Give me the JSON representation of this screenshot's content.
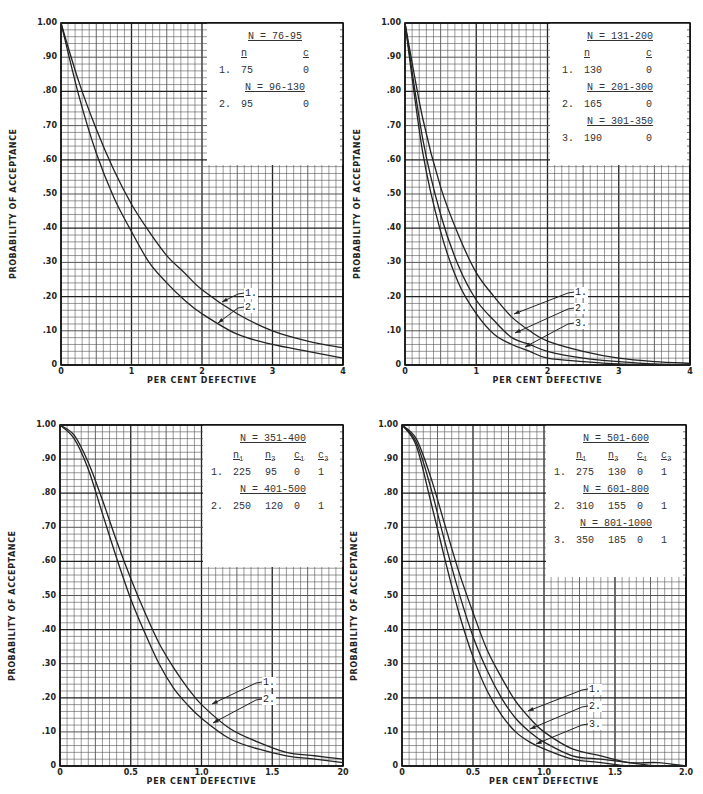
{
  "charts": [
    {
      "id": "tl",
      "box": {
        "left": 61,
        "top": 23,
        "width": 282,
        "height": 342
      },
      "x_label": "PER CENT DEFECTIVE",
      "y_label": "PROBABILITY OF ACCEPTANCE",
      "x_ticks": [
        "0",
        "1",
        "2",
        "3",
        "4"
      ],
      "x_max": 4,
      "y_ticks": [
        "0",
        ".10",
        ".20",
        ".30",
        ".40",
        ".50",
        ".60",
        ".70",
        ".80",
        ".90",
        "1.00"
      ],
      "legend": {
        "box": {
          "left": 207,
          "top": 23,
          "width": 136,
          "height": 142
        },
        "columns": [
          "n",
          "c"
        ],
        "groups": [
          {
            "header": "N = 76-95",
            "row": {
              "label": "1.",
              "values": [
                "75",
                "0"
              ]
            }
          },
          {
            "header": "N = 96-130",
            "row": {
              "label": "2.",
              "values": [
                "95",
                "0"
              ]
            }
          }
        ]
      },
      "callouts": [
        {
          "label": "1.",
          "text_x": 240,
          "text_y": 288,
          "arrow_to_x": 222,
          "arrow_to_y": 302
        },
        {
          "label": "2.",
          "text_x": 240,
          "text_y": 302,
          "arrow_to_x": 218,
          "arrow_to_y": 323
        }
      ]
    },
    {
      "id": "tr",
      "box": {
        "left": 405,
        "top": 23,
        "width": 285,
        "height": 342
      },
      "x_label": "PER CENT DEFECTIVE",
      "y_label": "PROBABILITY OF ACCEPTANCE",
      "x_ticks": [
        "0",
        "1",
        "2",
        "3",
        "4"
      ],
      "x_max": 4,
      "y_ticks": [
        "0",
        ".10",
        ".20",
        ".30",
        ".40",
        ".50",
        ".60",
        ".70",
        ".80",
        ".90",
        "1.00"
      ],
      "legend": {
        "box": {
          "left": 550,
          "top": 23,
          "width": 140,
          "height": 142
        },
        "columns": [
          "n",
          "c"
        ],
        "groups": [
          {
            "header": "N = 131-200",
            "row": {
              "label": "1.",
              "values": [
                "130",
                "0"
              ]
            }
          },
          {
            "header": "N = 201-300",
            "row": {
              "label": "2.",
              "values": [
                "165",
                "0"
              ]
            }
          },
          {
            "header": "N = 301-350",
            "row": {
              "label": "3.",
              "values": [
                "190",
                "0"
              ]
            }
          }
        ]
      },
      "callouts": [
        {
          "label": "1.",
          "text_x": 570,
          "text_y": 287,
          "arrow_to_x": 514,
          "arrow_to_y": 314
        },
        {
          "label": "2.",
          "text_x": 570,
          "text_y": 303,
          "arrow_to_x": 515,
          "arrow_to_y": 333
        },
        {
          "label": "3.",
          "text_x": 570,
          "text_y": 318,
          "arrow_to_x": 525,
          "arrow_to_y": 347
        }
      ]
    },
    {
      "id": "bl",
      "box": {
        "left": 60,
        "top": 425,
        "width": 283,
        "height": 341
      },
      "x_label": "PER CENT DEFECTIVE",
      "y_label": "PROBABILITY OF ACCEPTANCE",
      "x_ticks": [
        "0",
        "0.5",
        "1.0",
        "1.5",
        "20"
      ],
      "x_max": 2,
      "y_ticks": [
        "0",
        ".10",
        ".20",
        ".30",
        ".40",
        ".50",
        ".60",
        ".70",
        ".80",
        ".90",
        "1.00"
      ],
      "legend": {
        "box": {
          "left": 203,
          "top": 425,
          "width": 140,
          "height": 142
        },
        "columns": [
          "n1",
          "n2",
          "c1",
          "c2"
        ],
        "groups": [
          {
            "header": "N = 351-400",
            "row": {
              "label": "1.",
              "values": [
                "225",
                "95",
                "0",
                "1"
              ]
            }
          },
          {
            "header": "N = 401-500",
            "row": {
              "label": "2.",
              "values": [
                "250",
                "120",
                "0",
                "1"
              ]
            }
          }
        ]
      },
      "callouts": [
        {
          "label": "1.",
          "text_x": 258,
          "text_y": 677,
          "arrow_to_x": 212,
          "arrow_to_y": 704
        },
        {
          "label": "2.",
          "text_x": 258,
          "text_y": 694,
          "arrow_to_x": 213,
          "arrow_to_y": 723
        }
      ]
    },
    {
      "id": "br",
      "box": {
        "left": 402,
        "top": 425,
        "width": 284,
        "height": 341
      },
      "x_label": "PER CENT DEFECTIVE",
      "y_label": "PROBABILITY OF ACCEPTANCE",
      "x_ticks": [
        "0",
        "0.5",
        "1.0",
        "1.5",
        "2.0"
      ],
      "x_max": 2,
      "y_ticks": [
        "0",
        ".10",
        ".20",
        ".30",
        ".40",
        ".50",
        ".60",
        ".70",
        ".80",
        ".90",
        "1.00"
      ],
      "legend": {
        "box": {
          "left": 546,
          "top": 425,
          "width": 140,
          "height": 152
        },
        "columns": [
          "n1",
          "n2",
          "c1",
          "c2"
        ],
        "groups": [
          {
            "header": "N = 501-600",
            "row": {
              "label": "1.",
              "values": [
                "275",
                "130",
                "0",
                "1"
              ]
            }
          },
          {
            "header": "N = 601-800",
            "row": {
              "label": "2.",
              "values": [
                "310",
                "155",
                "0",
                "1"
              ]
            }
          },
          {
            "header": "N = 801-1000",
            "row": {
              "label": "3.",
              "values": [
                "350",
                "185",
                "0",
                "1"
              ]
            }
          }
        ]
      },
      "callouts": [
        {
          "label": "1.",
          "text_x": 584,
          "text_y": 684,
          "arrow_to_x": 528,
          "arrow_to_y": 711
        },
        {
          "label": "2.",
          "text_x": 584,
          "text_y": 701,
          "arrow_to_x": 530,
          "arrow_to_y": 729
        },
        {
          "label": "3.",
          "text_x": 584,
          "text_y": 719,
          "arrow_to_x": 536,
          "arrow_to_y": 744
        }
      ]
    }
  ],
  "chart_data": [
    {
      "type": "line",
      "title": "",
      "xlabel": "PER CENT DEFECTIVE",
      "ylabel": "PROBABILITY OF ACCEPTANCE",
      "xlim": [
        0,
        4
      ],
      "ylim": [
        0,
        1.0
      ],
      "grid": true,
      "x_ticks": [
        "0",
        "1",
        "2",
        "3",
        "4"
      ],
      "y_ticks": [
        "0",
        ".10",
        ".20",
        ".30",
        ".40",
        ".50",
        ".60",
        ".70",
        ".80",
        ".90",
        "1.00"
      ],
      "legend": [
        "1. N = 76-95: n=75, c=0",
        "2. N = 96-130: n=95, c=0"
      ],
      "x": [
        0,
        0.25,
        0.5,
        0.75,
        1.0,
        1.25,
        1.5,
        1.75,
        2.0,
        2.5,
        3.0,
        3.5,
        4.0
      ],
      "series": [
        {
          "name": "1. n=75 c=0",
          "values": [
            1.0,
            0.83,
            0.69,
            0.57,
            0.47,
            0.39,
            0.32,
            0.27,
            0.22,
            0.15,
            0.1,
            0.07,
            0.05
          ]
        },
        {
          "name": "2. n=95 c=0",
          "values": [
            1.0,
            0.79,
            0.62,
            0.49,
            0.39,
            0.3,
            0.24,
            0.19,
            0.15,
            0.09,
            0.06,
            0.04,
            0.02
          ]
        }
      ]
    },
    {
      "type": "line",
      "title": "",
      "xlabel": "PER CENT DEFECTIVE",
      "ylabel": "PROBABILITY OF ACCEPTANCE",
      "xlim": [
        0,
        4
      ],
      "ylim": [
        0,
        1.0
      ],
      "grid": true,
      "x_ticks": [
        "0",
        "1",
        "2",
        "3",
        "4"
      ],
      "y_ticks": [
        "0",
        ".10",
        ".20",
        ".30",
        ".40",
        ".50",
        ".60",
        ".70",
        ".80",
        ".90",
        "1.00"
      ],
      "legend": [
        "1. N = 131-200: n=130, c=0",
        "2. N = 201-300: n=165, c=0",
        "3. N = 301-350: n=190, c=0"
      ],
      "x": [
        0,
        0.25,
        0.5,
        0.75,
        1.0,
        1.25,
        1.5,
        1.75,
        2.0,
        2.5,
        3.0,
        3.5,
        4.0
      ],
      "series": [
        {
          "name": "1. n=130 c=0",
          "values": [
            1.0,
            0.72,
            0.52,
            0.38,
            0.27,
            0.2,
            0.14,
            0.1,
            0.07,
            0.04,
            0.02,
            0.01,
            0.005
          ]
        },
        {
          "name": "2. n=165 c=0",
          "values": [
            1.0,
            0.66,
            0.44,
            0.29,
            0.19,
            0.13,
            0.08,
            0.06,
            0.04,
            0.02,
            0.01,
            0.003,
            0.001
          ]
        },
        {
          "name": "3. n=190 c=0",
          "values": [
            1.0,
            0.62,
            0.39,
            0.24,
            0.15,
            0.09,
            0.06,
            0.04,
            0.02,
            0.01,
            0.003,
            0.001,
            0.0
          ]
        }
      ]
    },
    {
      "type": "line",
      "title": "",
      "xlabel": "PER CENT DEFECTIVE",
      "ylabel": "PROBABILITY OF ACCEPTANCE",
      "xlim": [
        0,
        2.0
      ],
      "ylim": [
        0,
        1.0
      ],
      "grid": true,
      "x_ticks": [
        "0",
        "0.5",
        "1.0",
        "1.5",
        "20"
      ],
      "y_ticks": [
        "0",
        ".10",
        ".20",
        ".30",
        ".40",
        ".50",
        ".60",
        ".70",
        ".80",
        ".90",
        "1.00"
      ],
      "legend": [
        "1. N = 351-400: n1=225, n2=95, c1=0, c2=1",
        "2. N = 401-500: n1=250, n2=120, c1=0, c2=1"
      ],
      "x": [
        0,
        0.1,
        0.2,
        0.3,
        0.4,
        0.5,
        0.6,
        0.7,
        0.8,
        0.9,
        1.0,
        1.2,
        1.4,
        1.6,
        1.8,
        2.0
      ],
      "series": [
        {
          "name": "1. n1=225 n2=95 c1=0 c2=1",
          "values": [
            1.0,
            0.97,
            0.89,
            0.78,
            0.66,
            0.55,
            0.45,
            0.36,
            0.29,
            0.23,
            0.18,
            0.11,
            0.07,
            0.04,
            0.03,
            0.02
          ]
        },
        {
          "name": "2. n1=250 n2=120 c1=0 c2=1",
          "values": [
            1.0,
            0.96,
            0.87,
            0.74,
            0.61,
            0.49,
            0.39,
            0.3,
            0.23,
            0.18,
            0.14,
            0.08,
            0.05,
            0.03,
            0.02,
            0.01
          ]
        }
      ]
    },
    {
      "type": "line",
      "title": "",
      "xlabel": "PER CENT DEFECTIVE",
      "ylabel": "PROBABILITY OF ACCEPTANCE",
      "xlim": [
        0,
        2.0
      ],
      "ylim": [
        0,
        1.0
      ],
      "grid": true,
      "x_ticks": [
        "0",
        "0.5",
        "1.0",
        "1.5",
        "2.0"
      ],
      "y_ticks": [
        "0",
        ".10",
        ".20",
        ".30",
        ".40",
        ".50",
        ".60",
        ".70",
        ".80",
        ".90",
        "1.00"
      ],
      "legend": [
        "1. N = 501-600: n1=275, n2=130, c1=0, c2=1",
        "2. N = 601-800: n1=310, n2=155, c1=0, c2=1",
        "3. N = 801-1000: n1=350, n2=185, c1=0, c2=1"
      ],
      "x": [
        0,
        0.1,
        0.2,
        0.3,
        0.4,
        0.5,
        0.6,
        0.7,
        0.8,
        0.9,
        1.0,
        1.2,
        1.4,
        1.6,
        1.8,
        2.0
      ],
      "series": [
        {
          "name": "1. n1=275 n2=130 c1=0 c2=1",
          "values": [
            1.0,
            0.96,
            0.85,
            0.71,
            0.57,
            0.45,
            0.34,
            0.26,
            0.19,
            0.14,
            0.1,
            0.05,
            0.03,
            0.01,
            0.01,
            0.0
          ]
        },
        {
          "name": "2. n1=310 n2=155 c1=0 c2=1",
          "values": [
            1.0,
            0.95,
            0.82,
            0.66,
            0.51,
            0.38,
            0.28,
            0.2,
            0.14,
            0.1,
            0.07,
            0.03,
            0.02,
            0.01,
            0.0,
            0.0
          ]
        },
        {
          "name": "3. n1=350 n2=185 c1=0 c2=1",
          "values": [
            1.0,
            0.94,
            0.78,
            0.61,
            0.45,
            0.32,
            0.22,
            0.15,
            0.1,
            0.07,
            0.05,
            0.02,
            0.01,
            0.0,
            0.0,
            0.0
          ]
        }
      ]
    }
  ]
}
